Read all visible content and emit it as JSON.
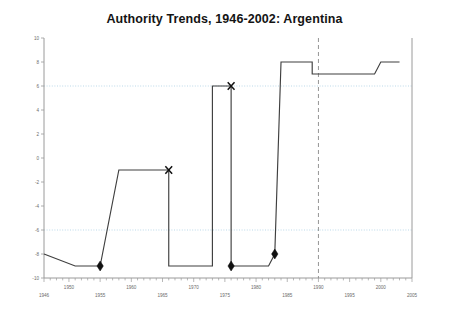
{
  "chart_data": {
    "type": "line",
    "title": "Authority Trends, 1946-2002: Argentina",
    "xlabel": "",
    "ylabel": "",
    "xlim": [
      1946,
      2005
    ],
    "ylim": [
      -10,
      10
    ],
    "yticks": [
      10,
      8,
      6,
      4,
      2,
      0,
      -2,
      -4,
      -6,
      -8,
      -10
    ],
    "ytick_labels": [
      "10",
      "8",
      "6",
      "4",
      "2",
      "0",
      "-2",
      "-4",
      "-6",
      "-8",
      "-10"
    ],
    "xticks": [
      1946,
      1950,
      1955,
      1960,
      1965,
      1970,
      1975,
      1980,
      1985,
      1990,
      1995,
      2000,
      2005
    ],
    "xtick_labels": [
      "1946",
      "1950",
      "1955",
      "1960",
      "1965",
      "1970",
      "1975",
      "1980",
      "1985",
      "1990",
      "1995",
      "2000",
      "2005"
    ],
    "xtick_row": [
      "low",
      "high",
      "low",
      "high",
      "low",
      "high",
      "low",
      "high",
      "low",
      "high",
      "low",
      "high",
      "low"
    ],
    "grid": "horizontal-dotted",
    "gridlines_y": [
      6,
      -6
    ],
    "legend": "none",
    "series": [
      {
        "name": "Polity Score",
        "x": [
          1946,
          1951,
          1955,
          1955,
          1958,
          1966,
          1966,
          1973,
          1973,
          1976,
          1976,
          1982,
          1983,
          1983,
          1984,
          1989,
          1989,
          1999,
          2000,
          2003
        ],
        "values": [
          -8,
          -9,
          -9,
          -9,
          -1,
          -1,
          -9,
          -9,
          6,
          6,
          -9,
          -9,
          -8,
          -8,
          8,
          8,
          7,
          7,
          8,
          8
        ]
      }
    ],
    "annotations": [
      {
        "marker": "diamond",
        "x": 1955,
        "y": -9,
        "label": "regime-transition-marker"
      },
      {
        "marker": "x",
        "x": 1966,
        "y": -1,
        "label": "regime-failure-marker"
      },
      {
        "marker": "x",
        "x": 1976,
        "y": 6,
        "label": "regime-failure-marker"
      },
      {
        "marker": "diamond",
        "x": 1976,
        "y": -9,
        "label": "regime-transition-marker"
      },
      {
        "marker": "diamond",
        "x": 1983,
        "y": -8,
        "label": "regime-transition-marker"
      }
    ],
    "reference_line": {
      "orientation": "vertical",
      "x": 1990,
      "style": "dashed"
    },
    "colors": {
      "line": "#3f3f3f",
      "axis": "#9a9a9a",
      "grid": "#9fc8e0",
      "marker": "#111111",
      "title": "#141414",
      "tick_text": "#6b6b6b",
      "reference_line": "#8a8a8a",
      "background": "#ffffff"
    }
  }
}
